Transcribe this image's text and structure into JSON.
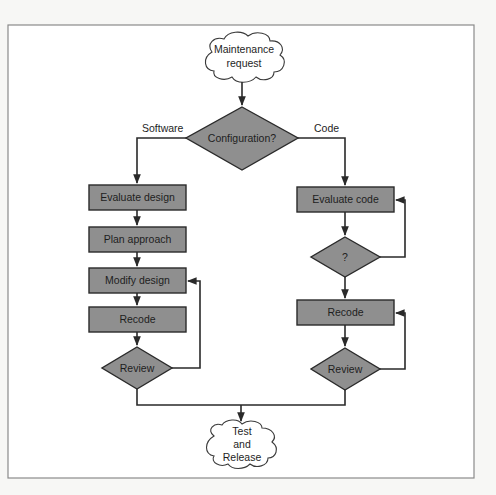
{
  "diagram": {
    "type": "flowchart",
    "start": {
      "label_line1": "Maintenance",
      "label_line2": "request"
    },
    "decision": {
      "label": "Configuration?"
    },
    "branches": {
      "left_label": "Software",
      "right_label": "Code"
    },
    "software_path": {
      "steps": [
        {
          "label": "Evaluate design"
        },
        {
          "label": "Plan approach"
        },
        {
          "label": "Modify design"
        },
        {
          "label": "Recode"
        }
      ],
      "review": {
        "label": "Review"
      }
    },
    "code_path": {
      "evaluate": {
        "label": "Evaluate code"
      },
      "check": {
        "label": "?"
      },
      "recode": {
        "label": "Recode"
      },
      "review": {
        "label": "Review"
      }
    },
    "end": {
      "label_line1": "Test",
      "label_line2": "and",
      "label_line3": "Release"
    },
    "colors": {
      "box_fill": "#8f8f8f",
      "stroke": "#2a2a2a",
      "background": "#ffffff"
    }
  }
}
